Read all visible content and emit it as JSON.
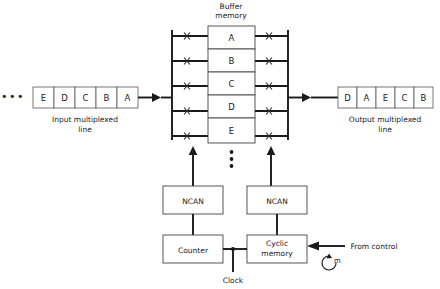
{
  "diagram": {
    "buffer": {
      "title_line1": "Buffer",
      "title_line2": "memory",
      "cells": [
        "A",
        "B",
        "C",
        "D",
        "E"
      ],
      "continuation_dots": "vertical-ellipsis"
    },
    "input": {
      "leading_ellipsis": "•••",
      "cells": [
        "E",
        "D",
        "C",
        "B",
        "A"
      ],
      "caption_line1": "Input  multiplexed",
      "caption_line2": "line"
    },
    "output": {
      "cells": [
        "D",
        "A",
        "E",
        "C",
        "B"
      ],
      "caption_line1": "Output multiplexed",
      "caption_line2": "line"
    },
    "blocks": {
      "ncan_left": "NCAN",
      "ncan_right": "NCAN",
      "counter": "Counter",
      "cyclic_line1": "Cyclic",
      "cyclic_line2": "memory"
    },
    "labels": {
      "clock": "Clock",
      "from_control": "From control",
      "modulus": "m"
    },
    "colors": {
      "ink": "#1a1a1a",
      "wire": "#1a1a1a",
      "box_stroke": "#555555",
      "background": "#ffffff"
    }
  }
}
